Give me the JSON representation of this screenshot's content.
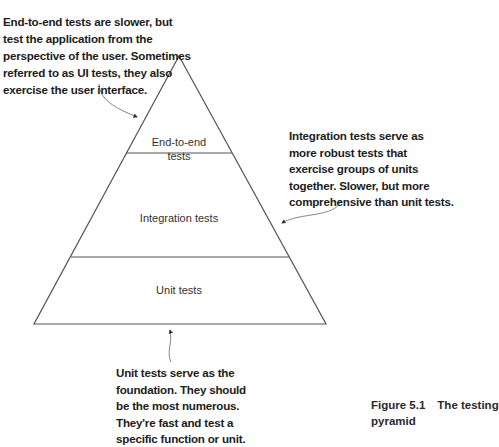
{
  "diagram": {
    "title": "The testing pyramid",
    "layers": [
      {
        "id": "e2e",
        "label_lines": [
          "End-to-end",
          "tests"
        ]
      },
      {
        "id": "integration",
        "label_lines": [
          "Integration tests"
        ]
      },
      {
        "id": "unit",
        "label_lines": [
          "Unit tests"
        ]
      }
    ],
    "annotations": {
      "e2e": {
        "lines": [
          "End-to-end tests are slower, but",
          "test the application from the",
          "perspective of the user. Sometimes",
          "referred to as UI tests, they also",
          "exercise the user interface."
        ]
      },
      "integration": {
        "lines": [
          "Integration tests serve as",
          "more robust tests that",
          "exercise groups of units",
          "together. Slower, but more",
          "comprehensive than unit tests."
        ]
      },
      "unit": {
        "lines": [
          "Unit tests serve as the",
          "foundation. They should",
          "be the most numerous.",
          "They're fast and test a",
          "specific function or unit."
        ]
      }
    },
    "caption": {
      "number": "Figure 5.1",
      "text_line1": "The testing",
      "text_line2": "pyramid"
    },
    "colors": {
      "outline": "#555555",
      "arrow": "#777777",
      "text": "#1c1c1c"
    }
  }
}
